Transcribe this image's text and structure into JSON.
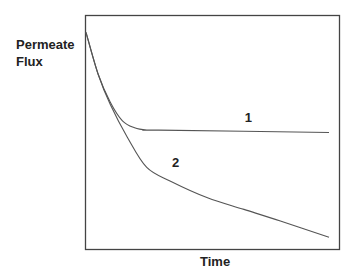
{
  "chart_data": {
    "type": "line",
    "title": "",
    "xlabel": "Time",
    "ylabel": "Permeate Flux",
    "ylabel_lines": [
      "Permeate",
      "Flux"
    ],
    "xlim": [
      0,
      1
    ],
    "ylim": [
      0,
      1
    ],
    "grid": false,
    "legend": "none (inline curve labels)",
    "series": [
      {
        "name": "1",
        "description": "Flux declines then levels off at a steady-state plateau",
        "x": [
          0.0,
          0.05,
          0.1,
          0.15,
          0.2,
          0.25,
          0.3,
          1.0
        ],
        "y": [
          0.93,
          0.75,
          0.63,
          0.55,
          0.52,
          0.51,
          0.51,
          0.5
        ]
      },
      {
        "name": "2",
        "description": "Flux declines continuously over time",
        "x": [
          0.0,
          0.05,
          0.1,
          0.17,
          0.25,
          0.35,
          0.5,
          0.65,
          0.8,
          1.0
        ],
        "y": [
          0.93,
          0.75,
          0.62,
          0.48,
          0.35,
          0.29,
          0.22,
          0.17,
          0.12,
          0.05
        ]
      }
    ],
    "annotations": [
      {
        "text": "1",
        "near_series": "1"
      },
      {
        "text": "2",
        "near_series": "2"
      }
    ]
  }
}
